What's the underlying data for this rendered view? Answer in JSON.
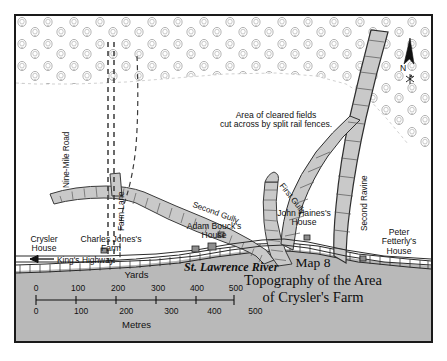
{
  "map": {
    "title_lines": [
      "Map 8",
      "Topography of the Area",
      "of Crysler's Farm"
    ],
    "title_number": "Map 8",
    "title_main": "Topography of the Area",
    "title_sub": "of Crysler's Farm",
    "north_label": "N",
    "annotation": {
      "line1": "Area of cleared fields",
      "line2": "cut across by split rail fences."
    },
    "water_label": "St. Lawrence River",
    "roads": [
      {
        "name": "nine-mile-road",
        "label": "Nine-Mile Road"
      },
      {
        "name": "farm-lane",
        "label": "Farm Lane"
      },
      {
        "name": "kings-highway",
        "label": "King's Highway"
      }
    ],
    "terrain_labels": [
      {
        "name": "second-gully",
        "label": "Second Gully"
      },
      {
        "name": "first-gully",
        "label": "First Gully"
      },
      {
        "name": "second-ravine",
        "label": "Second Ravine"
      }
    ],
    "places": [
      {
        "name": "crysler-house",
        "line1": "Crysler",
        "line2": "House"
      },
      {
        "name": "charles-joness-farm",
        "line1": "Charles Jones's",
        "line2": "Farm"
      },
      {
        "name": "adam-boucks-house",
        "line1": "Adam Bouck's",
        "line2": "House"
      },
      {
        "name": "john-hainess-house",
        "line1": "John Haines's",
        "line2": "House"
      },
      {
        "name": "peter-fetterlys-house",
        "line1": "Peter",
        "line2": "Fetterly's",
        "line3": "House"
      }
    ],
    "scale": {
      "yards": {
        "unit_label": "Yards",
        "ticks": [
          "0",
          "100",
          "200",
          "300",
          "400",
          "500"
        ],
        "positions_pct": [
          1,
          21.5,
          41,
          60.5,
          79.5,
          98.5
        ]
      },
      "metres": {
        "unit_label": "Metres",
        "ticks": [
          "0",
          "100",
          "200",
          "300",
          "400",
          "500"
        ],
        "positions_pct": [
          1,
          23,
          45,
          67,
          88,
          108
        ]
      }
    },
    "colors": {
      "frame_border": "#1a1a1a",
      "map_background": "#d9d9d9",
      "cleared_field": "#ffffff",
      "water": "#b9b9b9",
      "gully_fill": "#c9c9c9",
      "forest_symbol": "#9a9a9a",
      "ink": "#111111"
    }
  }
}
